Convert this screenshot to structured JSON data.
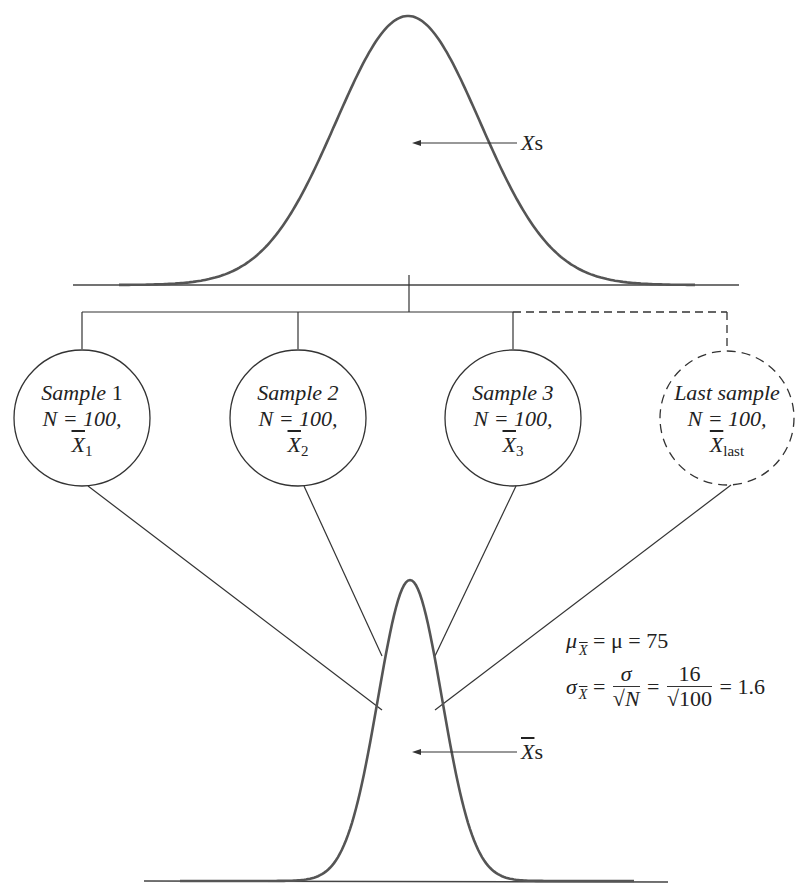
{
  "diagram": {
    "type": "sampling-distribution-of-means",
    "population": {
      "label_var": "X",
      "label_suffix": "s",
      "mean_x": 408,
      "peak_y": 16,
      "baseline_y": 285,
      "sigma_px": 72
    },
    "samples": [
      {
        "name": "Sample",
        "num": " 1",
        "n_line": "N = 100,",
        "mean_var": "X",
        "mean_sub": "1",
        "style": "solid"
      },
      {
        "name": "Sample 2",
        "num": "",
        "n_line": "N = 100,",
        "mean_var": "X",
        "mean_sub": "2",
        "style": "solid"
      },
      {
        "name": "Sample 3",
        "num": "",
        "n_line": "N = 100,",
        "mean_var": "X",
        "mean_sub": "3",
        "style": "solid"
      },
      {
        "name": "Last sample",
        "num": "",
        "n_line": "N = 100,",
        "mean_var": "X",
        "mean_sub": "last",
        "style": "dashed"
      }
    ],
    "sampling_distribution": {
      "label_var": "X",
      "label_suffix": "s",
      "mean_x": 410,
      "peak_y": 580,
      "baseline_y": 881,
      "sigma_px": 32
    },
    "formulas": {
      "mu_sym": "μ",
      "mu_sub": "X",
      "mu_eq": "= μ  = 75",
      "sigma_sym": "σ",
      "sigma_sub": "X",
      "eq1": "=",
      "frac1_num": "σ",
      "frac1_den": "√N",
      "eq2": "=",
      "frac2_num": "16",
      "frac2_den": "√100",
      "result": "= 1.6"
    },
    "values": {
      "population_mean": 75,
      "population_sd": 16,
      "sample_size": 100,
      "standard_error": 1.6
    }
  }
}
